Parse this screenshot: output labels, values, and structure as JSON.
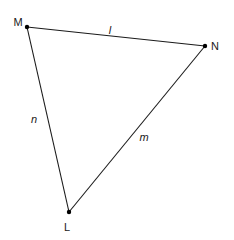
{
  "diagram": {
    "type": "triangle",
    "vertices": [
      {
        "id": "M",
        "label": "M",
        "x": 27,
        "y": 27,
        "lx": 18,
        "ly": 26
      },
      {
        "id": "N",
        "label": "N",
        "x": 205,
        "y": 46,
        "lx": 215,
        "ly": 50
      },
      {
        "id": "L",
        "label": "L",
        "x": 69,
        "y": 212,
        "lx": 67,
        "ly": 231
      }
    ],
    "sides": [
      {
        "id": "l",
        "label": "l",
        "from": "M",
        "to": "N",
        "lx": 110,
        "ly": 34
      },
      {
        "id": "m",
        "label": "m",
        "from": "N",
        "to": "L",
        "lx": 144,
        "ly": 141
      },
      {
        "id": "n",
        "label": "n",
        "from": "L",
        "to": "M",
        "lx": 34,
        "ly": 123
      }
    ],
    "colors": {
      "line": "#1a1a1a",
      "point": "#000000",
      "background": "#ffffff"
    }
  }
}
